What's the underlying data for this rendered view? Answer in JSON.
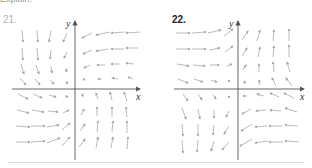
{
  "header_fragment": "Explain.",
  "colors": {
    "arrow": "#a9a9a9",
    "axis": "#555555",
    "num21": "#b0b0b0",
    "num22": "#222222",
    "rule": "#d8d8d8"
  },
  "graphs": [
    {
      "number": "21.",
      "x_label": "x",
      "y_label": "y",
      "origin": [
        75,
        89
      ],
      "description": "Vector field: upper-left arrows point down, upper-right point left, lower-left point right, lower-right point up"
    },
    {
      "number": "22.",
      "x_label": "x",
      "y_label": "y",
      "origin": [
        238,
        89
      ],
      "description": "Vector field: upper-left arrows point right, upper-right point up, lower-left point down, lower-right point left"
    }
  ]
}
